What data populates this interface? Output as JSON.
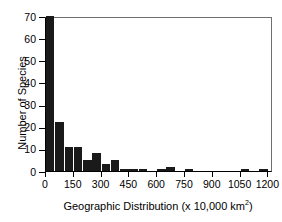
{
  "chart_data": {
    "type": "bar",
    "title": "",
    "subtitle": "",
    "xlabel": "Geographic Distribution (x 10,000 km",
    "xlabel_superscript": "2",
    "xlabel_suffix": ")",
    "ylabel": "Number of Species",
    "xlim": [
      0,
      1225
    ],
    "ylim": [
      0,
      70
    ],
    "bin_width": 50,
    "grid": false,
    "legend": null,
    "bar_color": "#1a1a1a",
    "xticks": [
      0,
      150,
      300,
      450,
      600,
      750,
      900,
      1050,
      1200
    ],
    "xtick_labels": [
      "0",
      "150",
      "300",
      "450",
      "600",
      "750",
      "900",
      "1050",
      "1200"
    ],
    "yticks": [
      0,
      10,
      20,
      30,
      40,
      50,
      60,
      70
    ],
    "ytick_labels": [
      "0",
      "10",
      "20",
      "30",
      "40",
      "50",
      "60",
      "70"
    ],
    "bin_starts": [
      0,
      50,
      100,
      150,
      200,
      250,
      300,
      350,
      400,
      450,
      500,
      550,
      600,
      650,
      700,
      750,
      800,
      850,
      900,
      950,
      1000,
      1050,
      1100,
      1150,
      1200
    ],
    "values": [
      70,
      22,
      11,
      11,
      5,
      8,
      3,
      5,
      1,
      1,
      1,
      0,
      1,
      2,
      0,
      1,
      0,
      0,
      0,
      0,
      0,
      1,
      0,
      1,
      0
    ]
  }
}
